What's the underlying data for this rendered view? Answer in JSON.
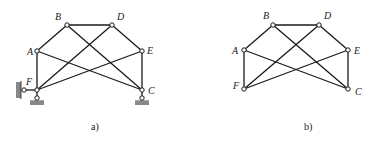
{
  "figures": [
    {
      "id": "a",
      "caption": "a)",
      "nodes": {
        "A": {
          "label": "A",
          "x": 37,
          "y": 51
        },
        "B": {
          "label": "B",
          "x": 67,
          "y": 25
        },
        "D": {
          "label": "D",
          "x": 112,
          "y": 25
        },
        "E": {
          "label": "E",
          "x": 142,
          "y": 51
        },
        "F": {
          "label": "F",
          "x": 37,
          "y": 90
        },
        "C": {
          "label": "C",
          "x": 142,
          "y": 90
        }
      },
      "members": [
        [
          "A",
          "B"
        ],
        [
          "B",
          "D"
        ],
        [
          "D",
          "E"
        ],
        [
          "A",
          "F"
        ],
        [
          "E",
          "C"
        ],
        [
          "B",
          "C"
        ],
        [
          "D",
          "F"
        ],
        [
          "A",
          "C"
        ],
        [
          "E",
          "F"
        ]
      ],
      "supports": [
        {
          "node": "F",
          "type": "pin-roller-wall-left"
        },
        {
          "node": "F",
          "type": "roller-ground"
        },
        {
          "node": "C",
          "type": "roller-ground"
        }
      ]
    },
    {
      "id": "b",
      "caption": "b)",
      "nodes": {
        "A": {
          "label": "A",
          "x": 244,
          "y": 50
        },
        "B": {
          "label": "B",
          "x": 273,
          "y": 25
        },
        "D": {
          "label": "D",
          "x": 319,
          "y": 25
        },
        "E": {
          "label": "E",
          "x": 348,
          "y": 50
        },
        "F": {
          "label": "F",
          "x": 244,
          "y": 89
        },
        "C": {
          "label": "C",
          "x": 348,
          "y": 89
        }
      },
      "members": [
        [
          "A",
          "B"
        ],
        [
          "B",
          "D"
        ],
        [
          "D",
          "E"
        ],
        [
          "A",
          "F"
        ],
        [
          "E",
          "C"
        ],
        [
          "B",
          "C"
        ],
        [
          "D",
          "F"
        ],
        [
          "A",
          "C"
        ],
        [
          "E",
          "F"
        ]
      ],
      "supports": []
    }
  ]
}
